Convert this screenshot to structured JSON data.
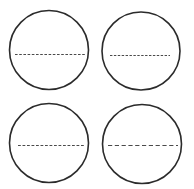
{
  "figure": {
    "background_color": "#ffffff",
    "width": 194,
    "height": 189,
    "stroke_color": "#2b2b2b",
    "dash_color": "#4a4a4a",
    "layout": "2x2 grid"
  },
  "chart_data": {
    "type": "scatter",
    "xlabel": "",
    "ylabel": "",
    "xlim": [
      0,
      194
    ],
    "ylim": [
      0,
      189
    ],
    "grid": false,
    "legend": "none",
    "series": [
      {
        "name": "circle-top-left",
        "shape": "circle",
        "cx": 49,
        "cy": 50,
        "r": 39.5,
        "stroke_width": 1.6,
        "chord": {
          "x1": 15,
          "x2": 85,
          "y": 54.5,
          "dash_pattern": "2.6 1.6",
          "stroke_width": 1.1
        }
      },
      {
        "name": "circle-top-right",
        "shape": "circle",
        "cx": 141,
        "cy": 51,
        "r": 39,
        "stroke_width": 1.6,
        "chord": {
          "x1": 110,
          "x2": 170,
          "y": 55.5,
          "dash_pattern": "2.4 1.5",
          "stroke_width": 1.1
        }
      },
      {
        "name": "circle-bottom-left",
        "shape": "circle",
        "cx": 49,
        "cy": 143,
        "r": 39.5,
        "stroke_width": 1.6,
        "chord": {
          "x1": 18,
          "x2": 85,
          "y": 145.5,
          "dash_pattern": "2.8 1.7",
          "stroke_width": 1.1
        }
      },
      {
        "name": "circle-bottom-right",
        "shape": "circle",
        "cx": 142,
        "cy": 144,
        "r": 39.5,
        "stroke_width": 1.6,
        "chord": {
          "x1": 108,
          "x2": 178,
          "y": 145.5,
          "dash_pattern": "4.2 2.6",
          "stroke_width": 1.2
        }
      }
    ]
  }
}
